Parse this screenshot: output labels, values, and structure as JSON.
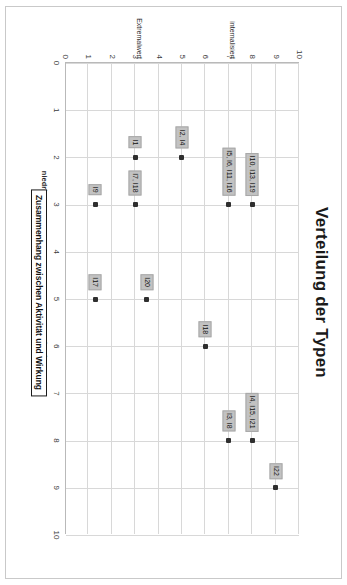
{
  "chart_data": {
    "type": "scatter",
    "title": "Verteilung der Typen",
    "xlabel": "Zusammenhang zwischen Aktivität und Wirkung",
    "ylabel": "Ziele und Kennzahlen als professionelle Werte",
    "xlim": [
      0,
      10
    ],
    "ylim": [
      0,
      10
    ],
    "xticks": [
      "0",
      "1",
      "2",
      "3",
      "4",
      "5",
      "6",
      "7",
      "8",
      "9",
      "10"
    ],
    "yticks": [
      "0",
      "1",
      "2",
      "3",
      "4",
      "5",
      "6",
      "7",
      "8",
      "9",
      "10"
    ],
    "grid": true,
    "legend": "none",
    "x_category_labels": [
      {
        "text": "niedrig",
        "x": 2.55
      },
      {
        "text": "hoch",
        "x": 6.1
      }
    ],
    "y_category_labels": [
      {
        "text": "internalisiert",
        "y": 7.1
      },
      {
        "text": "Extremalwert",
        "y": 3.1
      }
    ],
    "points": [
      {
        "x": 9,
        "y": 9,
        "label": "I22",
        "label_pos": "above-left"
      },
      {
        "x": 8,
        "y": 8,
        "label": "I4, I15, I21",
        "label_pos": "above-left"
      },
      {
        "x": 8,
        "y": 7,
        "label": "I3, I8",
        "label_pos": "left"
      },
      {
        "x": 6,
        "y": 6,
        "label": "I18",
        "label_pos": "left"
      },
      {
        "x": 3,
        "y": 8,
        "label": "I10, I13, I19",
        "label_pos": "left"
      },
      {
        "x": 3,
        "y": 7,
        "label": "I5, I6, I11, I16",
        "label_pos": "left"
      },
      {
        "x": 2,
        "y": 5,
        "label": "I2, I4",
        "label_pos": "left"
      },
      {
        "x": 5,
        "y": 3.5,
        "label": "I20",
        "label_pos": "left"
      },
      {
        "x": 5,
        "y": 1.3,
        "label": "I17",
        "label_pos": "left"
      },
      {
        "x": 3,
        "y": 3,
        "label": "I7, I18",
        "label_pos": "left"
      },
      {
        "x": 3,
        "y": 1.3,
        "label": "I9",
        "label_pos": "left"
      },
      {
        "x": 2,
        "y": 3,
        "label": "I1",
        "label_pos": "left"
      }
    ]
  }
}
